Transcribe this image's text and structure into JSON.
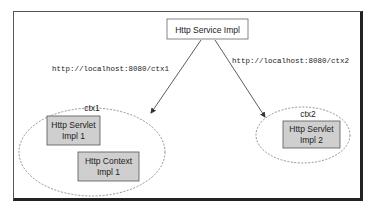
{
  "diagram": {
    "service": {
      "label": "Http Service Impl"
    },
    "links": [
      {
        "url": "http://localhost:8080/ctx1",
        "target": "ctx1"
      },
      {
        "url": "http://localhost:8080/ctx2",
        "target": "ctx2"
      }
    ],
    "contexts": [
      {
        "name": "ctx1",
        "components": [
          {
            "line1": "Http Servlet",
            "line2": "Impl 1"
          },
          {
            "line1": "Http Context",
            "line2": "Impl 1"
          }
        ]
      },
      {
        "name": "ctx2",
        "components": [
          {
            "line1": "Http Servlet",
            "line2": "Impl 2"
          }
        ]
      }
    ],
    "colors": {
      "component_fill": "#cfcfcf",
      "component_border": "#555555",
      "line": "#333333"
    }
  }
}
